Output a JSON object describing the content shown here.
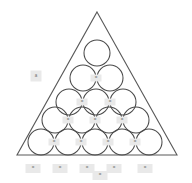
{
  "figure": {
    "background_color": "#ffffff",
    "outline_color": "#595959",
    "circle_stroke_color": "#4a4a4a",
    "marker_background_color": "#e9e9e9",
    "marker_text_color": "#6e6e6e"
  },
  "triangle": {
    "name": "bounding-triangle",
    "apex": {
      "x": 97,
      "y": 12
    },
    "bottom_left": {
      "x": 17,
      "y": 155
    },
    "bottom_right": {
      "x": 177,
      "y": 155
    }
  },
  "packing": {
    "row_count": 5,
    "circle_count": 15,
    "radius": 13,
    "rows": [
      {
        "index": 1,
        "count": 1,
        "circles": [
          {
            "id": "c-r1-1",
            "cx": 97,
            "cy": 53,
            "r": 13
          }
        ]
      },
      {
        "index": 2,
        "count": 2,
        "circles": [
          {
            "id": "c-r2-1",
            "cx": 83,
            "cy": 78,
            "r": 13
          },
          {
            "id": "c-r2-2",
            "cx": 110,
            "cy": 78,
            "r": 13
          }
        ]
      },
      {
        "index": 3,
        "count": 3,
        "circles": [
          {
            "id": "c-r3-1",
            "cx": 69,
            "cy": 102,
            "r": 13
          },
          {
            "id": "c-r3-2",
            "cx": 96,
            "cy": 102,
            "r": 13
          },
          {
            "id": "c-r3-3",
            "cx": 123,
            "cy": 102,
            "r": 13
          }
        ]
      },
      {
        "index": 4,
        "count": 4,
        "circles": [
          {
            "id": "c-r4-1",
            "cx": 55,
            "cy": 120,
            "r": 13
          },
          {
            "id": "c-r4-2",
            "cx": 82,
            "cy": 120,
            "r": 13
          },
          {
            "id": "c-r4-3",
            "cx": 109,
            "cy": 120,
            "r": 13
          },
          {
            "id": "c-r4-4",
            "cx": 136,
            "cy": 120,
            "r": 13
          }
        ]
      },
      {
        "index": 5,
        "count": 5,
        "circles": [
          {
            "id": "c-r5-1",
            "cx": 41,
            "cy": 142,
            "r": 13
          },
          {
            "id": "c-r5-2",
            "cx": 68,
            "cy": 142,
            "r": 13
          },
          {
            "id": "c-r5-3",
            "cx": 95,
            "cy": 142,
            "r": 13
          },
          {
            "id": "c-r5-4",
            "cx": 122,
            "cy": 142,
            "r": 13
          },
          {
            "id": "c-r5-5",
            "cx": 149,
            "cy": 142,
            "r": 13
          }
        ]
      }
    ]
  },
  "tangency_markers": [
    {
      "id": "m-r2",
      "x": 96,
      "y": 78,
      "label": "="
    },
    {
      "id": "m-r3-a",
      "x": 82,
      "y": 102,
      "label": "="
    },
    {
      "id": "m-r3-b",
      "x": 110,
      "y": 102,
      "label": "="
    },
    {
      "id": "m-r4-a",
      "x": 68,
      "y": 120,
      "label": "="
    },
    {
      "id": "m-r4-b",
      "x": 95,
      "y": 120,
      "label": "="
    },
    {
      "id": "m-r4-c",
      "x": 122,
      "y": 120,
      "label": "="
    },
    {
      "id": "m-r5-a",
      "x": 54,
      "y": 142,
      "label": "="
    },
    {
      "id": "m-r5-b",
      "x": 81,
      "y": 142,
      "label": "="
    },
    {
      "id": "m-r5-c",
      "x": 108,
      "y": 142,
      "label": "="
    },
    {
      "id": "m-r5-d",
      "x": 135,
      "y": 142,
      "label": "="
    }
  ],
  "corner_badge": {
    "name": "apex-angle-badge",
    "x": 36,
    "y": 76,
    "label": "a"
  },
  "baseline_labels": [
    {
      "id": "b1",
      "x": 33,
      "y": 164,
      "label": "="
    },
    {
      "id": "b2",
      "x": 60,
      "y": 164,
      "label": "="
    },
    {
      "id": "b3",
      "x": 87,
      "y": 164,
      "label": "="
    },
    {
      "id": "b4",
      "x": 100,
      "y": 171,
      "label": "="
    },
    {
      "id": "b5",
      "x": 114,
      "y": 164,
      "label": "="
    },
    {
      "id": "b6",
      "x": 145,
      "y": 164,
      "label": "="
    }
  ]
}
